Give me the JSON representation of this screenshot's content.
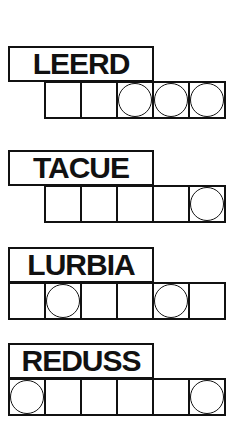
{
  "puzzles": [
    {
      "scrambled": "LEERD",
      "cells": [
        "",
        "",
        "",
        "",
        "",
        ""
      ],
      "cell_slots": [
        false,
        true,
        true,
        true,
        true,
        true
      ],
      "circled": [
        false,
        false,
        false,
        true,
        true,
        true
      ],
      "top": 46
    },
    {
      "scrambled": "TACUE",
      "cells": [
        "",
        "",
        "",
        "",
        "",
        ""
      ],
      "cell_slots": [
        false,
        true,
        true,
        true,
        true,
        true
      ],
      "circled": [
        false,
        false,
        false,
        false,
        false,
        true
      ],
      "top": 150
    },
    {
      "scrambled": "LURBIA",
      "cells": [
        "",
        "",
        "",
        "",
        "",
        ""
      ],
      "cell_slots": [
        true,
        true,
        true,
        true,
        true,
        true
      ],
      "circled": [
        false,
        true,
        false,
        false,
        true,
        false
      ],
      "top": 247
    },
    {
      "scrambled": "REDUSS",
      "cells": [
        "",
        "",
        "",
        "",
        "",
        ""
      ],
      "cell_slots": [
        true,
        true,
        true,
        true,
        true,
        true
      ],
      "circled": [
        true,
        false,
        false,
        false,
        false,
        true
      ],
      "top": 343
    }
  ]
}
